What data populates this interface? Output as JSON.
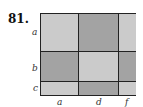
{
  "problem": {
    "number": "81."
  },
  "diagram": {
    "row_labels": [
      "a",
      "b",
      "c"
    ],
    "column_labels": [
      "a",
      "d",
      "f"
    ],
    "colors": {
      "light": "#cbcbcb",
      "dark": "#a3a3a3",
      "border": "#222222"
    },
    "cells": [
      [
        "light",
        "dark",
        "light"
      ],
      [
        "dark",
        "light",
        "dark"
      ],
      [
        "light",
        "dark",
        "light"
      ]
    ]
  }
}
